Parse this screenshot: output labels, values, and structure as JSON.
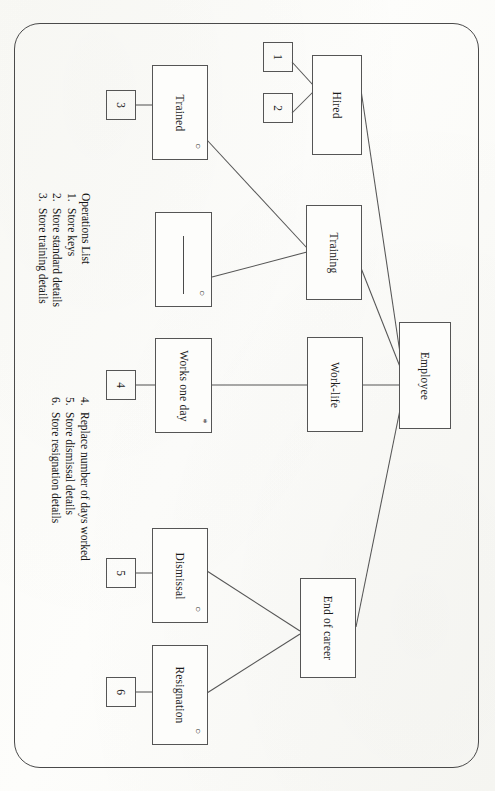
{
  "document": {
    "orientation": "rotated-90",
    "paper_color": "#fdfdfb",
    "ink_color": "#555555"
  },
  "diagram": {
    "type": "entity-state-diagram",
    "nodes": [
      {
        "id": "hired",
        "label": "Hired",
        "marker": ""
      },
      {
        "id": "trained",
        "label": "Trained",
        "marker": "○"
      },
      {
        "id": "training",
        "label": "Training",
        "marker": ""
      },
      {
        "id": "blank",
        "label": "",
        "marker": "○"
      },
      {
        "id": "works-one-day",
        "label": "Works one day",
        "marker": "*"
      },
      {
        "id": "work-life",
        "label": "Work-life",
        "marker": ""
      },
      {
        "id": "employee",
        "label": "Employee",
        "marker": ""
      },
      {
        "id": "dismissal",
        "label": "Dismissal",
        "marker": "○"
      },
      {
        "id": "resignation",
        "label": "Resignation",
        "marker": "○"
      },
      {
        "id": "end-of-career",
        "label": "End of career",
        "marker": ""
      }
    ],
    "number_boxes": [
      {
        "id": "n1",
        "label": "1",
        "attached_to": "hired"
      },
      {
        "id": "n2",
        "label": "2",
        "attached_to": "hired"
      },
      {
        "id": "n3",
        "label": "3",
        "attached_to": "trained"
      },
      {
        "id": "n4",
        "label": "4",
        "attached_to": "works-one-day"
      },
      {
        "id": "n5",
        "label": "5",
        "attached_to": "dismissal"
      },
      {
        "id": "n6",
        "label": "6",
        "attached_to": "resignation"
      }
    ],
    "edges": [
      {
        "from": "n1",
        "to": "hired"
      },
      {
        "from": "n2",
        "to": "hired"
      },
      {
        "from": "n3",
        "to": "trained"
      },
      {
        "from": "n4",
        "to": "works-one-day"
      },
      {
        "from": "n5",
        "to": "dismissal"
      },
      {
        "from": "n6",
        "to": "resignation"
      },
      {
        "from": "trained",
        "to": "training"
      },
      {
        "from": "blank",
        "to": "training"
      },
      {
        "from": "works-one-day",
        "to": "work-life"
      },
      {
        "from": "work-life",
        "to": "employee"
      },
      {
        "from": "hired",
        "to": "employee"
      },
      {
        "from": "training",
        "to": "employee"
      },
      {
        "from": "dismissal",
        "to": "end-of-career"
      },
      {
        "from": "resignation",
        "to": "end-of-career"
      },
      {
        "from": "end-of-career",
        "to": "employee"
      }
    ]
  },
  "operations": {
    "title": "Operations List",
    "column_left": [
      {
        "num": "1.",
        "text": "Store keys"
      },
      {
        "num": "2.",
        "text": "Store standard details"
      },
      {
        "num": "3.",
        "text": "Store training details"
      }
    ],
    "column_right": [
      {
        "num": "4.",
        "text": "Replace number of days worked"
      },
      {
        "num": "5.",
        "text": "Store dismissal details"
      },
      {
        "num": "6.",
        "text": "Store resignation details"
      }
    ]
  }
}
